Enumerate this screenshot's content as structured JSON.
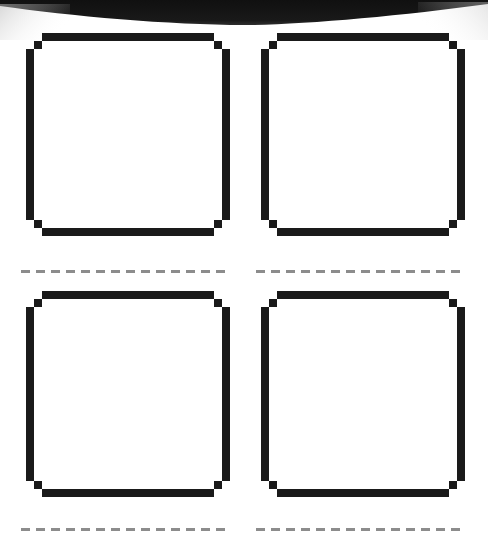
{
  "page": {
    "width": 488,
    "height": 539,
    "background_color": "#ffffff",
    "ink_color": "#1a1a1a",
    "dash_color": "#8c8c8c",
    "scan_band_color": "#141414"
  },
  "scan_band": {
    "name": "top-dark-scan-edge",
    "description": "dark curved band across the top of the scan",
    "color": "#141414",
    "left_edge_y": 6,
    "center_lowest_y": 25,
    "right_edge_y": 4
  },
  "grid": {
    "rows": 2,
    "columns": 2,
    "stroke_width": 8,
    "corner_step": 8,
    "cells": [
      {
        "id": "box-r1c1",
        "label": "",
        "row": 1,
        "column": 1,
        "x": 26,
        "y": 33,
        "width": 204,
        "height": 203,
        "filled": false,
        "fill_color": "#ffffff",
        "stroke_color": "#1a1a1a"
      },
      {
        "id": "box-r1c2",
        "label": "",
        "row": 1,
        "column": 2,
        "x": 261,
        "y": 33,
        "width": 204,
        "height": 203,
        "filled": false,
        "fill_color": "#ffffff",
        "stroke_color": "#1a1a1a"
      },
      {
        "id": "box-r2c1",
        "label": "",
        "row": 2,
        "column": 1,
        "x": 26,
        "y": 291,
        "width": 204,
        "height": 206,
        "filled": false,
        "fill_color": "#ffffff",
        "stroke_color": "#1a1a1a"
      },
      {
        "id": "box-r2c2",
        "label": "",
        "row": 2,
        "column": 2,
        "x": 261,
        "y": 291,
        "width": 204,
        "height": 206,
        "filled": false,
        "fill_color": "#ffffff",
        "stroke_color": "#1a1a1a"
      }
    ]
  },
  "separators": [
    {
      "id": "dash-r1c1",
      "after_row": 1,
      "column": 1,
      "x": 21,
      "y": 270,
      "width": 207,
      "dash_length": 9,
      "gap_length": 6,
      "thickness": 3,
      "color": "#8c8c8c"
    },
    {
      "id": "dash-r1c2",
      "after_row": 1,
      "column": 2,
      "x": 256,
      "y": 270,
      "width": 212,
      "dash_length": 9,
      "gap_length": 6,
      "thickness": 3,
      "color": "#8c8c8c"
    },
    {
      "id": "dash-r2c1",
      "after_row": 2,
      "column": 1,
      "x": 21,
      "y": 528,
      "width": 207,
      "dash_length": 9,
      "gap_length": 6,
      "thickness": 3,
      "color": "#8c8c8c"
    },
    {
      "id": "dash-r2c2",
      "after_row": 2,
      "column": 2,
      "x": 256,
      "y": 528,
      "width": 212,
      "dash_length": 9,
      "gap_length": 6,
      "thickness": 3,
      "color": "#8c8c8c"
    }
  ]
}
